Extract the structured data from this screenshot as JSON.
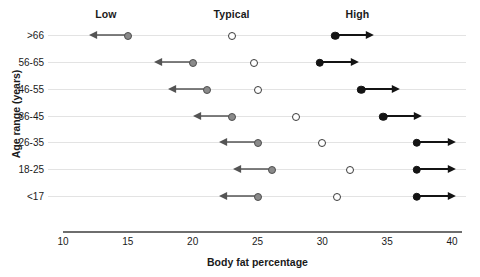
{
  "chart_data": {
    "type": "scatter",
    "title": "",
    "xlabel": "Body fat percentage",
    "ylabel": "Age range (years)",
    "xlim": [
      10,
      40
    ],
    "xticks": [
      10,
      15,
      20,
      25,
      30,
      35,
      40
    ],
    "grid": "horizontal row lines only",
    "legend_position": "top (column headers)",
    "column_headers": [
      {
        "label": "Low",
        "x": 13.3
      },
      {
        "label": "Typical",
        "x": 23.0
      },
      {
        "label": "High",
        "x": 32.7
      }
    ],
    "categories": [
      "<17",
      "18-25",
      "26-35",
      "36-45",
      "46-55",
      "56-65",
      ">66"
    ],
    "row_order_top_to_bottom": [
      ">66",
      "56-65",
      "46-55",
      "36-45",
      "26-35",
      "18-25",
      "<17"
    ],
    "series": [
      {
        "name": "Low",
        "marker": "gray filled circle with left arrow",
        "values_by_row_top_to_bottom": [
          15.0,
          20.0,
          21.1,
          23.0,
          25.0,
          26.1,
          25.0
        ],
        "arrow_direction": "left",
        "arrow_length_units": 3.0
      },
      {
        "name": "Typical",
        "marker": "open circle",
        "values_by_row_top_to_bottom": [
          23.0,
          24.7,
          25.0,
          28.0,
          30.0,
          32.1,
          31.1
        ],
        "arrow_direction": "none"
      },
      {
        "name": "High",
        "marker": "black filled circle with right arrow",
        "values_by_row_top_to_bottom": [
          31.0,
          29.8,
          33.0,
          34.7,
          37.3,
          37.3,
          37.3
        ],
        "arrow_direction": "right",
        "arrow_length_units": 3.0
      }
    ],
    "rows": [
      {
        "label": ">66",
        "low": 15.0,
        "typical": 23.0,
        "high": 31.0
      },
      {
        "label": "56-65",
        "low": 20.0,
        "typical": 24.7,
        "high": 29.8
      },
      {
        "label": "46-55",
        "low": 21.1,
        "typical": 25.0,
        "high": 33.0
      },
      {
        "label": "36-45",
        "low": 23.0,
        "typical": 28.0,
        "high": 34.7
      },
      {
        "label": "26-35",
        "low": 25.0,
        "typical": 30.0,
        "high": 37.3
      },
      {
        "label": "18-25",
        "low": 26.1,
        "typical": 32.1,
        "high": 37.3
      },
      {
        "label": "<17",
        "low": 25.0,
        "typical": 31.1,
        "high": 37.3
      }
    ],
    "colors": {
      "low_marker": "#8a8a8a",
      "typical_marker": "#ffffff",
      "high_marker": "#141414",
      "row_line": "#e3e3e3",
      "axis": "#6e6e6e",
      "text": "#1a1a1a"
    }
  }
}
